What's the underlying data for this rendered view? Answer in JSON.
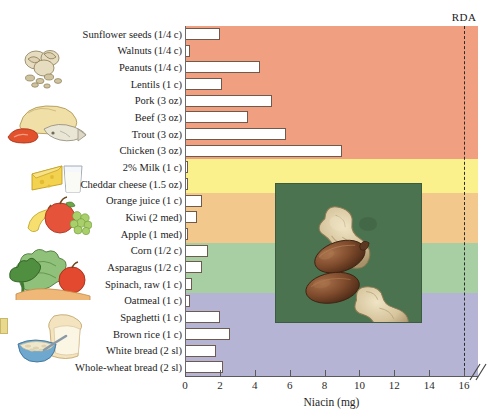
{
  "figure": {
    "axis_title": "Niacin (mg)",
    "rda_label": "RDA",
    "rda_value": 16,
    "x_ticks": [
      0,
      2,
      4,
      6,
      8,
      10,
      12,
      14,
      16
    ],
    "axis_break_note": "//"
  },
  "colors": {
    "band_meat": "#f0a080",
    "band_dairy": "#faf08c",
    "band_fruit": "#f2c88c",
    "band_vegetable": "#a8cfa4",
    "band_grain": "#b6b4d4",
    "bar_fill": "#ffffff",
    "bar_stroke": "#6e5b4e",
    "rda_line": "#2c2c2c",
    "photo_background": "#4c7350",
    "peanut_shell": "#d9c9a3",
    "peanut_kernel": "#7b4a2d"
  },
  "chart_data": {
    "type": "bar",
    "title": "",
    "xlabel": "Niacin (mg)",
    "ylabel": "",
    "xlim": [
      0,
      16.8
    ],
    "grid": false,
    "orientation": "horizontal",
    "categories": [
      "Sunflower seeds (1/4 c)",
      "Walnuts (1/4 c)",
      "Peanuts (1/4 c)",
      "Lentils (1 c)",
      "Pork (3 oz)",
      "Beef (3 oz)",
      "Trout (3 oz)",
      "Chicken (3 oz)",
      "2% Milk (1 c)",
      "Cheddar cheese (1.5 oz)",
      "Orange juice (1 c)",
      "Kiwi (2 med)",
      "Apple (1 med)",
      "Corn (1/2 c)",
      "Asparagus (1/2 c)",
      "Spinach, raw (1 c)",
      "Oatmeal (1 c)",
      "Spaghetti (1 c)",
      "Brown rice (1 c)",
      "White bread (2 sl)",
      "Whole-wheat bread (2 sl)"
    ],
    "values": [
      2.0,
      0.3,
      4.3,
      2.1,
      5.0,
      3.6,
      5.8,
      9.0,
      0.2,
      0.1,
      1.0,
      0.7,
      0.2,
      1.3,
      1.0,
      0.4,
      0.3,
      2.0,
      2.6,
      1.8,
      2.2
    ],
    "groups": [
      {
        "name": "protein-foods",
        "color": "#f0a080",
        "row_start": 0,
        "row_end": 7
      },
      {
        "name": "dairy",
        "color": "#faf08c",
        "row_start": 8,
        "row_end": 9
      },
      {
        "name": "fruits",
        "color": "#f2c88c",
        "row_start": 10,
        "row_end": 12
      },
      {
        "name": "vegetables",
        "color": "#a8cfa4",
        "row_start": 13,
        "row_end": 15
      },
      {
        "name": "grains",
        "color": "#b6b4d4",
        "row_start": 16,
        "row_end": 20
      }
    ],
    "annotations": [
      {
        "label": "RDA",
        "type": "vline",
        "x": 16
      }
    ]
  },
  "illustrations": [
    {
      "name": "nuts-seeds-illustration",
      "alt": "walnuts and seeds"
    },
    {
      "name": "meat-fish-illustration",
      "alt": "roast poultry, fish and meat"
    },
    {
      "name": "cheese-milk-illustration",
      "alt": "cheese wedge and glass of milk"
    },
    {
      "name": "fruit-illustration",
      "alt": "apple, banana and grapes"
    },
    {
      "name": "vegetable-illustration",
      "alt": "broccoli, cabbage and pepper"
    },
    {
      "name": "grains-illustration",
      "alt": "bowl of oatmeal and bread slice"
    }
  ],
  "photo": {
    "name": "peanut-photo",
    "caption": "",
    "alt": "Whole peanuts in shells and shelled peanut kernels on a green background"
  }
}
